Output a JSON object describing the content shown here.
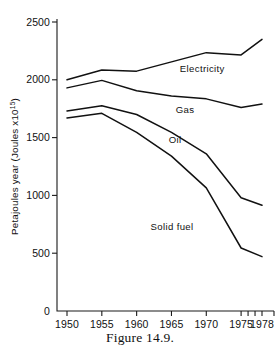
{
  "figure": {
    "caption": "Figure 14.9."
  },
  "chart_data": {
    "type": "line",
    "title": "",
    "subtitle": "",
    "xlabel": "",
    "ylabel": "Petajoules year (Joules x10",
    "ylabel_exponent": "15",
    "ylabel_close": ")",
    "ylabel_full": "Petajoules year (Joules x10¹⁵)",
    "x": [
      1950,
      1955,
      1960,
      1965,
      1970,
      1975,
      1978
    ],
    "xtick_labels": [
      "1950",
      "1955",
      "1960",
      "1965",
      "1970",
      "1975",
      "1978"
    ],
    "minor_xticks": [
      1976,
      1977
    ],
    "ytick_values": [
      0,
      500,
      1000,
      1500,
      2000,
      2500
    ],
    "ytick_labels": [
      "0",
      "500",
      "1000",
      "1500",
      "2000",
      "2500"
    ],
    "xlim": [
      1948.5,
      1978
    ],
    "ylim": [
      0,
      2500
    ],
    "grid": false,
    "legend": "inline-labels",
    "series": [
      {
        "name": "Electricity",
        "label": "Electricity",
        "label_x": 1966.2,
        "label_y": 2065,
        "values": [
          2000,
          2085,
          2075,
          2155,
          2235,
          2215,
          2350
        ]
      },
      {
        "name": "Gas",
        "label": "Gas",
        "label_x": 1965.6,
        "label_y": 1715,
        "values": [
          1930,
          1995,
          1905,
          1860,
          1835,
          1760,
          1790
        ]
      },
      {
        "name": "Oil",
        "label": "Oil",
        "label_x": 1964.6,
        "label_y": 1455,
        "values": [
          1730,
          1775,
          1700,
          1545,
          1360,
          980,
          915
        ]
      },
      {
        "name": "Solid fuel",
        "label": "Solid fuel",
        "label_x": 1962.0,
        "label_y": 700,
        "values": [
          1670,
          1710,
          1545,
          1340,
          1065,
          545,
          470
        ]
      }
    ]
  }
}
